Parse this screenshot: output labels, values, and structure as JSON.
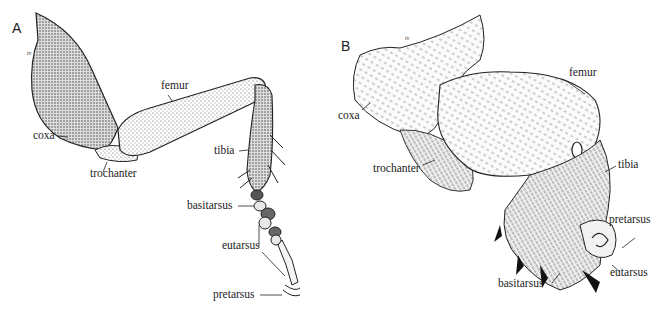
{
  "figure": {
    "panels": [
      {
        "id": "A",
        "letter": "A",
        "tv_mark": "tv",
        "labels": {
          "coxa": "coxa",
          "femur": "femur",
          "trochanter": "trochanter",
          "tibia": "tibia",
          "basitarsus": "basitarsus",
          "eutarsus": "eutarsus",
          "pretarsus": "pretarsus"
        }
      },
      {
        "id": "B",
        "letter": "B",
        "tv_mark": "tv",
        "labels": {
          "coxa": "coxa",
          "femur": "femur",
          "trochanter": "trochanter",
          "tibia": "tibia",
          "basitarsus": "basitarsus",
          "eutarsus": "eutarsus",
          "pretarsus": "pretarsus"
        }
      }
    ],
    "colors": {
      "ink": "#222222",
      "background": "#ffffff",
      "shade": "#cfcfcf"
    }
  }
}
